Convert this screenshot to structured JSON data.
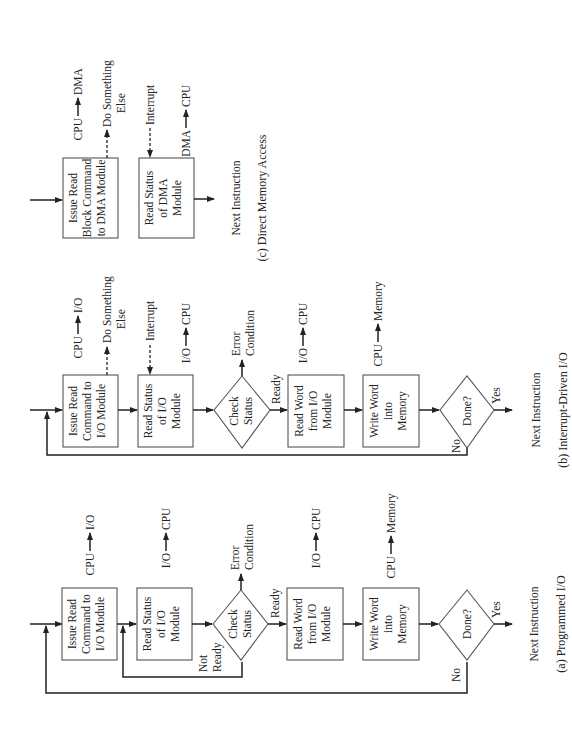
{
  "figure": {
    "panels": [
      {
        "id": "c",
        "caption": "(c) Direct Memory Access",
        "steps": [
          {
            "type": "box",
            "lines": [
              "Issue Read",
              "Block Command",
              "to DMA Module"
            ],
            "side_label": "CPU → DMA",
            "side_from": "CPU",
            "side_to": "DMA",
            "dashed_out": [
              "Do Something",
              "Else"
            ]
          },
          {
            "type": "box",
            "lines": [
              "Read Status",
              "of DMA",
              "Module"
            ],
            "dashed_in": "Interrupt",
            "side_from": "DMA",
            "side_to": "CPU"
          }
        ],
        "end": "Next Instruction"
      },
      {
        "id": "b",
        "caption": "(b) Interrupt-Driven I/O",
        "steps": [
          {
            "type": "box",
            "lines": [
              "Issue Read",
              "Command to",
              "I/O Module"
            ],
            "side_from": "CPU",
            "side_to": "I/O",
            "dashed_out": [
              "Do Something",
              "Else"
            ]
          },
          {
            "type": "box",
            "lines": [
              "Read Status",
              "of I/O",
              "Module"
            ],
            "dashed_in": "Interrupt",
            "side_from": "I/O",
            "side_to": "CPU"
          },
          {
            "type": "diamond",
            "lines": [
              "Check",
              "Status"
            ],
            "error": [
              "Error",
              "Condition"
            ],
            "ready": "Ready"
          },
          {
            "type": "box",
            "lines": [
              "Read Word",
              "from I/O",
              "Module"
            ],
            "side_from": "I/O",
            "side_to": "CPU"
          },
          {
            "type": "box",
            "lines": [
              "Write Word",
              "into",
              "Memory"
            ],
            "side_from": "CPU",
            "side_to": "Memory"
          },
          {
            "type": "diamond",
            "lines": [
              "Done?"
            ],
            "yes": "Yes",
            "no": "No"
          }
        ],
        "end": "Next Instruction"
      },
      {
        "id": "a",
        "caption": "(a) Programmed I/O",
        "steps": [
          {
            "type": "box",
            "lines": [
              "Issue Read",
              "Command to",
              "I/O Module"
            ],
            "side_from": "CPU",
            "side_to": "I/O"
          },
          {
            "type": "box",
            "lines": [
              "Read Status",
              "of I/O",
              "Module"
            ],
            "side_from": "I/O",
            "side_to": "CPU"
          },
          {
            "type": "diamond",
            "lines": [
              "Check",
              "Status"
            ],
            "error": [
              "Error",
              "Condition"
            ],
            "ready": "Ready",
            "not_ready": [
              "Not",
              "Ready"
            ]
          },
          {
            "type": "box",
            "lines": [
              "Read Word",
              "from I/O",
              "Module"
            ],
            "side_from": "I/O",
            "side_to": "CPU"
          },
          {
            "type": "box",
            "lines": [
              "Write Word",
              "into",
              "Memory"
            ],
            "side_from": "CPU",
            "side_to": "Memory"
          },
          {
            "type": "diamond",
            "lines": [
              "Done?"
            ],
            "yes": "Yes",
            "no": "No"
          }
        ],
        "end": "Next Instruction"
      }
    ]
  }
}
